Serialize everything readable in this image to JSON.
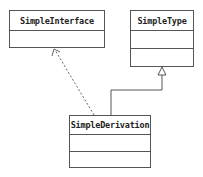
{
  "diagram": {
    "type": "uml-class-diagram",
    "classes": [
      {
        "id": "simple-interface",
        "name": "SimpleInterface",
        "compartments": 1
      },
      {
        "id": "simple-type",
        "name": "SimpleType",
        "compartments": 2
      },
      {
        "id": "simple-derivation",
        "name": "SimpleDerivation",
        "compartments": 2
      }
    ],
    "relations": [
      {
        "from": "SimpleDerivation",
        "to": "SimpleInterface",
        "kind": "realization",
        "style": "dashed"
      },
      {
        "from": "SimpleDerivation",
        "to": "SimpleType",
        "kind": "generalization",
        "style": "solid"
      }
    ],
    "colors": {
      "line": "#555555",
      "text": "#222222",
      "background": "#ffffff"
    }
  }
}
